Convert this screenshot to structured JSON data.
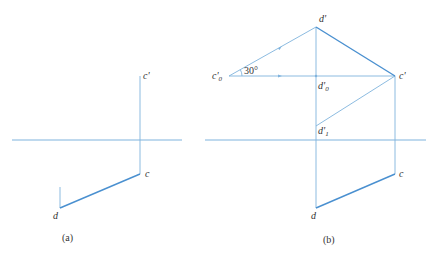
{
  "figures": {
    "a": {
      "caption": "(a)",
      "labels": {
        "c_prime": "c'",
        "c": "c",
        "d": "d"
      }
    },
    "b": {
      "caption": "(b)",
      "labels": {
        "d_prime": "d'",
        "c0_prime_main": "c'",
        "c0_prime_sub": "0",
        "angle": "30°",
        "c_prime": "c'",
        "d0_prime_main": "d'",
        "d0_prime_sub": "0",
        "d1_prime_main": "d'",
        "d1_prime_sub": "1",
        "c": "c",
        "d": "d"
      }
    }
  },
  "colors": {
    "line": "#7fb3dd",
    "emphasis_line": "#4a90d0",
    "text": "#333333"
  }
}
